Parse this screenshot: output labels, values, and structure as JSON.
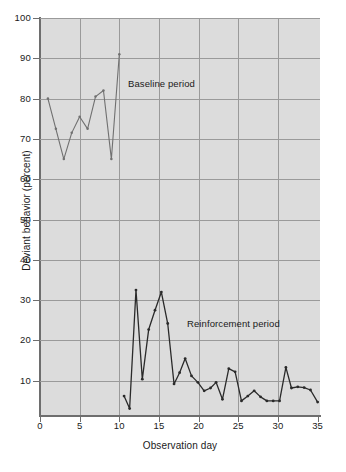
{
  "chart_data": {
    "type": "line",
    "title": "",
    "xlabel": "Observation day",
    "ylabel": "Deviant behavior (percent)",
    "xlim": [
      0,
      35.3
    ],
    "ylim": [
      1.5,
      100
    ],
    "grid": true,
    "legend_position": "inline-annotations",
    "xticks": [
      0,
      5,
      10,
      15,
      20,
      25,
      30,
      35
    ],
    "yticks": [
      10,
      20,
      30,
      40,
      50,
      60,
      70,
      80,
      90,
      100
    ],
    "annotations": [
      {
        "text": "Baseline period",
        "x": 11.1,
        "y": 84.5
      },
      {
        "text": "Reinforcement period",
        "x": 18.5,
        "y": 29.0
      }
    ],
    "series": [
      {
        "name": "Baseline period",
        "color": "#707070",
        "marker": "dot",
        "x": [
          1,
          2,
          3,
          4,
          5,
          6,
          7,
          8,
          9,
          10
        ],
        "values": [
          80,
          72.5,
          65,
          71.5,
          75.5,
          72.5,
          80.5,
          82,
          65,
          91
        ]
      },
      {
        "name": "Reinforcement period",
        "color": "#2a2a2a",
        "marker": "dot",
        "x": [
          10.6,
          11.3,
          12.1,
          12.9,
          13.7,
          14.5,
          15.3,
          16.1,
          16.9,
          17.6,
          18.3,
          19.1,
          19.9,
          20.7,
          21.5,
          22.2,
          23.0,
          23.8,
          24.6,
          25.4,
          26.2,
          27.0,
          27.8,
          28.6,
          29.4,
          30.2,
          31.0,
          31.7,
          32.5,
          33.3,
          34.1,
          35.0
        ],
        "values": [
          6.2,
          3.1,
          32.5,
          10.4,
          22.7,
          27.5,
          32.0,
          24.2,
          9.2,
          12.0,
          15.5,
          11.2,
          9.6,
          7.5,
          8.2,
          9.6,
          5.4,
          13.0,
          12.2,
          5.0,
          6.2,
          7.5,
          6.0,
          5.0,
          5.0,
          5.0,
          13.3,
          8.2,
          8.5,
          8.3,
          7.7,
          4.7
        ]
      }
    ]
  }
}
